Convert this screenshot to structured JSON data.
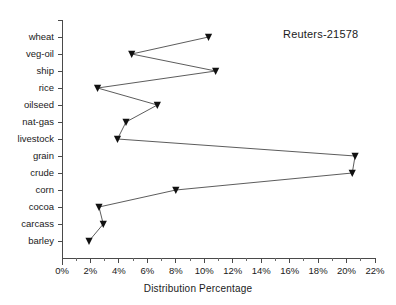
{
  "chart_data": {
    "type": "line",
    "title": "Reuters-21578",
    "xlabel": "Distribution Percentage",
    "ylabel": "",
    "orientation": "horizontal",
    "grid": false,
    "legend": null,
    "categories": [
      "wheat",
      "veg-oil",
      "ship",
      "rice",
      "oilseed",
      "nat-gas",
      "livestock",
      "grain",
      "crude",
      "corn",
      "cocoa",
      "carcass",
      "barley"
    ],
    "values": [
      10.3,
      4.9,
      10.8,
      2.5,
      6.7,
      4.5,
      3.9,
      20.6,
      20.4,
      8.0,
      2.6,
      2.9,
      1.9
    ],
    "xlim": [
      0,
      22
    ],
    "xtick_labels": [
      "0%",
      "2%",
      "4%",
      "6%",
      "8%",
      "10%",
      "12%",
      "14%",
      "16%",
      "18%",
      "20%",
      "22%"
    ],
    "xtick_values": [
      0,
      2,
      4,
      6,
      8,
      10,
      12,
      14,
      16,
      18,
      20,
      22
    ],
    "marker": "triangle-down",
    "marker_color": "#111111",
    "line_color": "#4a4a4a",
    "background_color": "#ffffff"
  },
  "layout": {
    "plot_left": 62,
    "plot_right": 375,
    "plot_top": 20,
    "plot_bottom": 258
  }
}
